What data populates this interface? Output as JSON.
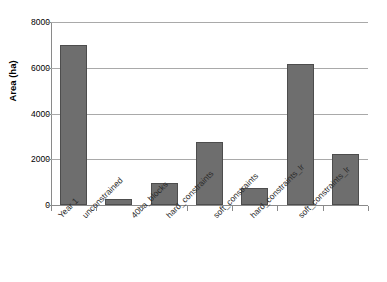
{
  "chart_data": {
    "type": "bar",
    "title": "",
    "subtitle": "",
    "xlabel": "",
    "ylabel": "Area (ha)",
    "categories": [
      "Year 1",
      "unconstrained",
      "40ha_blocks",
      "hard_constraints",
      "soft_constraints",
      "hard_constraints_lr",
      "soft_constraints_lr"
    ],
    "values": [
      7000,
      280,
      980,
      2750,
      750,
      6150,
      2250
    ],
    "series": [
      {
        "name": "Area (ha)",
        "values": [
          7000,
          280,
          980,
          2750,
          750,
          6150,
          2250
        ]
      }
    ],
    "ylim": [
      0,
      8000
    ],
    "yticks": [
      0,
      2000,
      4000,
      6000,
      8000
    ],
    "ytick_labels": [
      "0",
      "2000",
      "4000",
      "6000",
      "8000"
    ],
    "grid": "horizontal",
    "legend": "none",
    "bar_color": "#6e6e6e",
    "bar_border_color": "#4d4d4d",
    "gridline_color": "#a9a9a9",
    "axis_color": "#8a8a8a",
    "background_color": "#ffffff"
  }
}
